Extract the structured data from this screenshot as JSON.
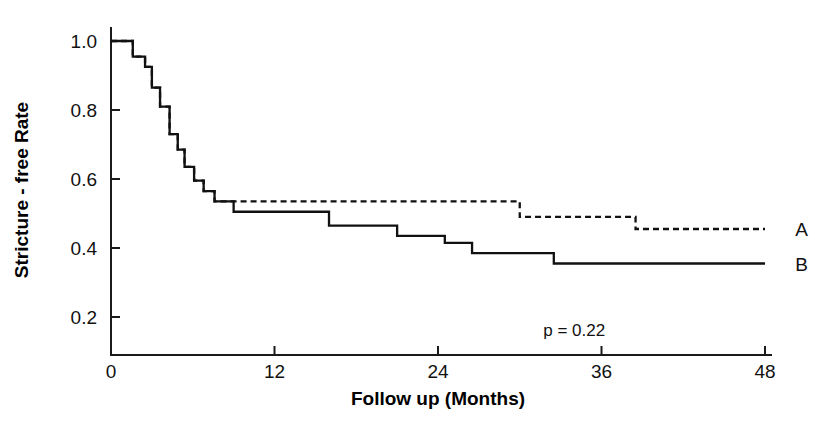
{
  "chart_data": {
    "type": "line",
    "title": "",
    "xlabel": "Follow up (Months)",
    "ylabel": "Stricture - free Rate",
    "xlim": [
      0,
      48
    ],
    "ylim": [
      0,
      1.05
    ],
    "xticks": [
      0,
      12,
      24,
      36,
      48
    ],
    "xtick_labels": [
      "0",
      "12",
      "24",
      "36",
      "48"
    ],
    "yticks": [
      0.2,
      0.4,
      0.6,
      0.8,
      1.0
    ],
    "ytick_labels": [
      "0.2",
      "0.4",
      "0.6",
      "0.8",
      "1.0"
    ],
    "grid": false,
    "legend_position": "right-inline",
    "annotations": [
      {
        "text": "p = 0.22",
        "x": 34.0,
        "y": 0.145
      }
    ],
    "series": [
      {
        "name": "A",
        "label": "A",
        "linestyle": "dashed",
        "color": "#111111",
        "label_x": 49.2,
        "label_y": 0.455,
        "points": [
          [
            0,
            1.0
          ],
          [
            1.6,
            1.0
          ],
          [
            1.6,
            0.955
          ],
          [
            2.5,
            0.955
          ],
          [
            2.5,
            0.925
          ],
          [
            3.0,
            0.925
          ],
          [
            3.0,
            0.865
          ],
          [
            3.6,
            0.865
          ],
          [
            3.6,
            0.81
          ],
          [
            4.3,
            0.81
          ],
          [
            4.3,
            0.73
          ],
          [
            4.9,
            0.73
          ],
          [
            4.9,
            0.685
          ],
          [
            5.4,
            0.685
          ],
          [
            5.4,
            0.635
          ],
          [
            6.1,
            0.635
          ],
          [
            6.1,
            0.595
          ],
          [
            6.8,
            0.595
          ],
          [
            6.8,
            0.565
          ],
          [
            7.6,
            0.565
          ],
          [
            7.6,
            0.535
          ],
          [
            9.0,
            0.535
          ],
          [
            30.0,
            0.535
          ],
          [
            30.0,
            0.49
          ],
          [
            38.5,
            0.49
          ],
          [
            38.5,
            0.455
          ],
          [
            48.0,
            0.455
          ]
        ]
      },
      {
        "name": "B",
        "label": "B",
        "linestyle": "solid",
        "color": "#111111",
        "label_x": 49.2,
        "label_y": 0.355,
        "points": [
          [
            0,
            1.0
          ],
          [
            1.6,
            1.0
          ],
          [
            1.6,
            0.955
          ],
          [
            2.5,
            0.955
          ],
          [
            2.5,
            0.925
          ],
          [
            3.0,
            0.925
          ],
          [
            3.0,
            0.865
          ],
          [
            3.6,
            0.865
          ],
          [
            3.6,
            0.81
          ],
          [
            4.3,
            0.81
          ],
          [
            4.3,
            0.73
          ],
          [
            4.9,
            0.73
          ],
          [
            4.9,
            0.685
          ],
          [
            5.4,
            0.685
          ],
          [
            5.4,
            0.635
          ],
          [
            6.1,
            0.635
          ],
          [
            6.1,
            0.595
          ],
          [
            6.8,
            0.595
          ],
          [
            6.8,
            0.565
          ],
          [
            7.6,
            0.565
          ],
          [
            7.6,
            0.535
          ],
          [
            9.0,
            0.535
          ],
          [
            9.0,
            0.505
          ],
          [
            16.0,
            0.505
          ],
          [
            16.0,
            0.465
          ],
          [
            21.0,
            0.465
          ],
          [
            21.0,
            0.435
          ],
          [
            24.5,
            0.435
          ],
          [
            24.5,
            0.415
          ],
          [
            26.5,
            0.415
          ],
          [
            26.5,
            0.385
          ],
          [
            32.5,
            0.385
          ],
          [
            32.5,
            0.355
          ],
          [
            48.0,
            0.355
          ]
        ]
      }
    ]
  },
  "axes": {
    "x_axis_name": "follow-up-months-axis",
    "y_axis_name": "stricture-free-rate-axis"
  }
}
